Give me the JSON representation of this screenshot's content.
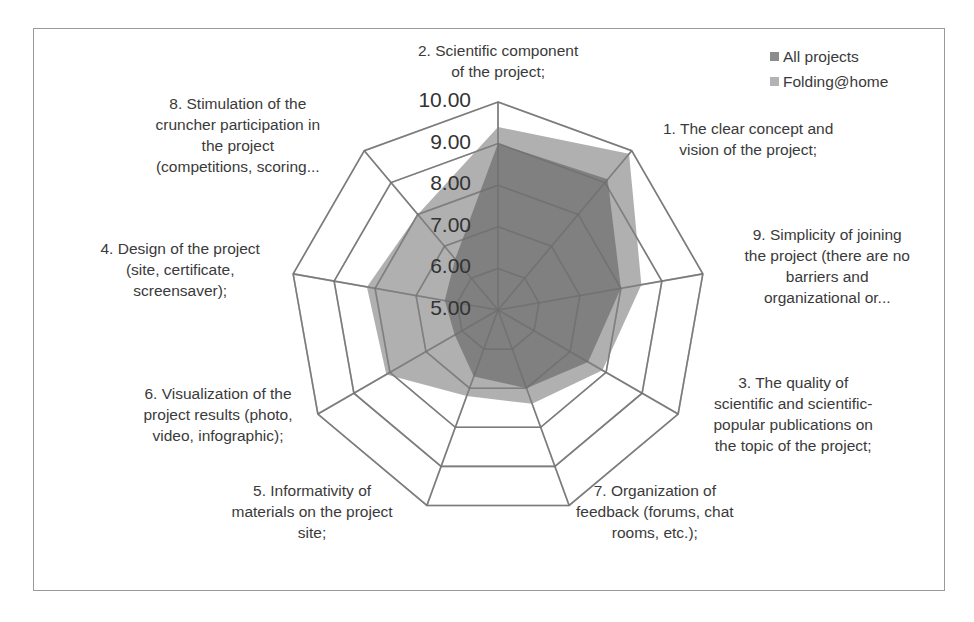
{
  "chart_data": {
    "type": "radar",
    "title": "",
    "range": [
      5,
      10
    ],
    "ticks": [
      "5.00",
      "6.00",
      "7.00",
      "8.00",
      "9.00",
      "10.00"
    ],
    "categories": [
      "2. Scientific component of the project;",
      "1. The clear concept and vision of the project;",
      "9. Simplicity of joining the project (there are no barriers and organizational or...",
      "3. The quality of scientific and scientific-popular publications on the topic of the project;",
      "7. Organization of feedback (forums, chat rooms, etc.);",
      "5. Informativity of materials on the project site;",
      "6. Visualization of the project results (photo, video, infographic);",
      "4. Design of the project (site, certificate, screensaver);",
      "8. Stimulation of the cruncher participation in the project (competitions, scoring..."
    ],
    "series": [
      {
        "name": "All projects",
        "color": "#7f7f7f",
        "values": [
          9.0,
          9.1,
          8.0,
          7.5,
          7.0,
          6.7,
          6.2,
          6.3,
          6.6
        ]
      },
      {
        "name": "Folding@home",
        "color": "#a6a6a6",
        "values": [
          9.4,
          9.9,
          8.5,
          7.9,
          7.4,
          7.2,
          8.1,
          8.2,
          8.0
        ]
      }
    ],
    "legend_position": "top-right",
    "grid": true
  },
  "axis_labels": [
    {
      "lines": [
        "2.  Scientific component",
        "of the project;"
      ]
    },
    {
      "lines": [
        "1.  The clear concept and",
        "vision of the project;"
      ]
    },
    {
      "lines": [
        "9.  Simplicity of joining",
        "the project (there are no",
        "barriers and",
        "organizational or..."
      ]
    },
    {
      "lines": [
        "3.  The quality of",
        "scientific and scientific-",
        "popular publications on",
        "the topic of the project;"
      ]
    },
    {
      "lines": [
        "7.  Organization of",
        "feedback (forums, chat",
        "rooms, etc.);"
      ]
    },
    {
      "lines": [
        "5.  Informativity of",
        "materials on the project",
        "site;"
      ]
    },
    {
      "lines": [
        "6.  Visualization of the",
        "project results (photo,",
        "video, infographic);"
      ]
    },
    {
      "lines": [
        "4.  Design of the project",
        "(site, certificate,",
        "screensaver);"
      ]
    },
    {
      "lines": [
        "8.  Stimulation of the",
        "cruncher participation in",
        "the project",
        "(competitions, scoring..."
      ]
    }
  ],
  "legend": [
    {
      "label": "All projects",
      "color": "#8c8c8c"
    },
    {
      "label": "Folding@home",
      "color": "#b3b3b3"
    }
  ]
}
